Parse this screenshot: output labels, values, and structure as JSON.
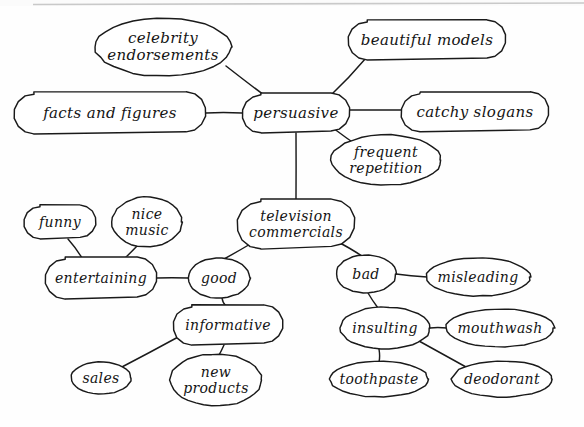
{
  "diagram": {
    "type": "hand-drawn mind map / concept web",
    "medium": "ink on paper, cursive handwriting",
    "ink_color": "#1a1a1a",
    "paper_color": "#fefefe",
    "scan_edge_color": "#c9c9c9",
    "width": 584,
    "height": 427
  },
  "nodes": [
    {
      "id": "celebrity_endorsements",
      "label_line1": "celebrity",
      "label_line2": "endorsements",
      "cx": 163,
      "cy": 47,
      "rx": 68,
      "ry": 29,
      "shape": "ellipse",
      "lines": 2,
      "font_size": 15
    },
    {
      "id": "beautiful_models",
      "label_line1": "beautiful  models",
      "label_line2": "",
      "cx": 427,
      "cy": 40,
      "rx": 79,
      "ry": 20,
      "shape": "rounded",
      "lines": 1,
      "font_size": 15
    },
    {
      "id": "facts_and_figures",
      "label_line1": "facts  and  figures",
      "label_line2": "",
      "cx": 110,
      "cy": 113,
      "rx": 96,
      "ry": 21,
      "shape": "rounded",
      "lines": 1,
      "font_size": 15
    },
    {
      "id": "persuasive",
      "label_line1": "persuasive",
      "label_line2": "",
      "cx": 296,
      "cy": 113,
      "rx": 54,
      "ry": 20,
      "shape": "rounded",
      "lines": 1,
      "font_size": 15
    },
    {
      "id": "catchy_slogans",
      "label_line1": "catchy  slogans",
      "label_line2": "",
      "cx": 475,
      "cy": 112,
      "rx": 74,
      "ry": 20,
      "shape": "rounded",
      "lines": 1,
      "font_size": 15
    },
    {
      "id": "frequent_repetition",
      "label_line1": "frequent",
      "label_line2": "repetition",
      "cx": 386,
      "cy": 160,
      "rx": 55,
      "ry": 25,
      "shape": "ellipse",
      "lines": 2,
      "font_size": 14
    },
    {
      "id": "television_commercials",
      "label_line1": "television",
      "label_line2": "commercials",
      "cx": 296,
      "cy": 224,
      "rx": 59,
      "ry": 25,
      "shape": "rounded",
      "lines": 2,
      "font_size": 14
    },
    {
      "id": "funny",
      "label_line1": "funny",
      "label_line2": "",
      "cx": 60,
      "cy": 222,
      "rx": 36,
      "ry": 17,
      "shape": "rounded",
      "lines": 1,
      "font_size": 14
    },
    {
      "id": "nice_music",
      "label_line1": "nice",
      "label_line2": "music",
      "cx": 147,
      "cy": 222,
      "rx": 35,
      "ry": 25,
      "shape": "ellipse",
      "lines": 2,
      "font_size": 14
    },
    {
      "id": "entertaining",
      "label_line1": "entertaining",
      "label_line2": "",
      "cx": 101,
      "cy": 278,
      "rx": 56,
      "ry": 21,
      "shape": "rounded",
      "lines": 1,
      "font_size": 14
    },
    {
      "id": "good",
      "label_line1": "good",
      "label_line2": "",
      "cx": 219,
      "cy": 278,
      "rx": 31,
      "ry": 20,
      "shape": "ellipse",
      "lines": 1,
      "font_size": 14
    },
    {
      "id": "bad",
      "label_line1": "bad",
      "label_line2": "",
      "cx": 366,
      "cy": 274,
      "rx": 30,
      "ry": 19,
      "shape": "ellipse",
      "lines": 1,
      "font_size": 14
    },
    {
      "id": "misleading",
      "label_line1": "misleading",
      "label_line2": "",
      "cx": 478,
      "cy": 277,
      "rx": 52,
      "ry": 19,
      "shape": "ellipse",
      "lines": 1,
      "font_size": 14
    },
    {
      "id": "informative",
      "label_line1": "informative",
      "label_line2": "",
      "cx": 228,
      "cy": 325,
      "rx": 55,
      "ry": 20,
      "shape": "rounded",
      "lines": 1,
      "font_size": 14
    },
    {
      "id": "insulting",
      "label_line1": "insulting",
      "label_line2": "",
      "cx": 385,
      "cy": 328,
      "rx": 45,
      "ry": 21,
      "shape": "ellipse",
      "lines": 1,
      "font_size": 14
    },
    {
      "id": "mouthwash",
      "label_line1": "mouthwash",
      "label_line2": "",
      "cx": 500,
      "cy": 328,
      "rx": 54,
      "ry": 19,
      "shape": "ellipse",
      "lines": 1,
      "font_size": 14
    },
    {
      "id": "sales",
      "label_line1": "sales",
      "label_line2": "",
      "cx": 101,
      "cy": 378,
      "rx": 30,
      "ry": 16,
      "shape": "ellipse",
      "lines": 1,
      "font_size": 14
    },
    {
      "id": "new_products",
      "label_line1": "new",
      "label_line2": "products",
      "cx": 216,
      "cy": 380,
      "rx": 46,
      "ry": 26,
      "shape": "ellipse",
      "lines": 2,
      "font_size": 14
    },
    {
      "id": "toothpaste",
      "label_line1": "toothpaste",
      "label_line2": "",
      "cx": 379,
      "cy": 379,
      "rx": 49,
      "ry": 18,
      "shape": "ellipse",
      "lines": 1,
      "font_size": 14
    },
    {
      "id": "deodorant",
      "label_line1": "deodorant",
      "label_line2": "",
      "cx": 502,
      "cy": 379,
      "rx": 50,
      "ry": 18,
      "shape": "ellipse",
      "lines": 1,
      "font_size": 14
    }
  ],
  "edges": [
    {
      "id": "e1",
      "from": "celebrity_endorsements",
      "to": "persuasive",
      "x1": 226,
      "y1": 66,
      "x2": 268,
      "y2": 98
    },
    {
      "id": "e2",
      "from": "beautiful_models",
      "to": "persuasive",
      "x1": 366,
      "y1": 58,
      "x2": 330,
      "y2": 96
    },
    {
      "id": "e3",
      "from": "facts_and_figures",
      "to": "persuasive",
      "x1": 206,
      "y1": 113,
      "x2": 242,
      "y2": 113
    },
    {
      "id": "e4",
      "from": "persuasive",
      "to": "catchy_slogans",
      "x1": 350,
      "y1": 110,
      "x2": 401,
      "y2": 110
    },
    {
      "id": "e5",
      "from": "persuasive",
      "to": "frequent_repetition",
      "x1": 333,
      "y1": 128,
      "x2": 358,
      "y2": 146
    },
    {
      "id": "e6",
      "from": "persuasive",
      "to": "television_commercials",
      "x1": 296,
      "y1": 133,
      "x2": 296,
      "y2": 200
    },
    {
      "id": "e7",
      "from": "television_commercials",
      "to": "good",
      "x1": 252,
      "y1": 243,
      "x2": 224,
      "y2": 259
    },
    {
      "id": "e8",
      "from": "television_commercials",
      "to": "bad",
      "x1": 340,
      "y1": 243,
      "x2": 362,
      "y2": 256
    },
    {
      "id": "e9",
      "from": "funny",
      "to": "entertaining",
      "x1": 68,
      "y1": 239,
      "x2": 82,
      "y2": 258
    },
    {
      "id": "e10",
      "from": "nice_music",
      "to": "entertaining",
      "x1": 137,
      "y1": 246,
      "x2": 124,
      "y2": 259
    },
    {
      "id": "e11",
      "from": "entertaining",
      "to": "good",
      "x1": 157,
      "y1": 278,
      "x2": 188,
      "y2": 278
    },
    {
      "id": "e12",
      "from": "good",
      "to": "informative",
      "x1": 222,
      "y1": 298,
      "x2": 226,
      "y2": 306
    },
    {
      "id": "e13",
      "from": "informative",
      "to": "sales",
      "x1": 180,
      "y1": 336,
      "x2": 120,
      "y2": 368
    },
    {
      "id": "e14",
      "from": "informative",
      "to": "new_products",
      "x1": 224,
      "y1": 345,
      "x2": 219,
      "y2": 355
    },
    {
      "id": "e15",
      "from": "bad",
      "to": "misleading",
      "x1": 396,
      "y1": 274,
      "x2": 427,
      "y2": 277
    },
    {
      "id": "e16",
      "from": "bad",
      "to": "insulting",
      "x1": 368,
      "y1": 293,
      "x2": 378,
      "y2": 308
    },
    {
      "id": "e17",
      "from": "insulting",
      "to": "mouthwash",
      "x1": 430,
      "y1": 328,
      "x2": 447,
      "y2": 328
    },
    {
      "id": "e18",
      "from": "insulting",
      "to": "toothpaste",
      "x1": 379,
      "y1": 349,
      "x2": 379,
      "y2": 362
    },
    {
      "id": "e19",
      "from": "insulting",
      "to": "deodorant",
      "x1": 419,
      "y1": 341,
      "x2": 466,
      "y2": 367
    }
  ],
  "branches": {
    "persuasive_children": [
      "celebrity endorsements",
      "beautiful models",
      "facts and figures",
      "catchy slogans",
      "frequent repetition"
    ],
    "good_children": [
      "entertaining",
      "informative"
    ],
    "entertaining_children": [
      "funny",
      "nice music"
    ],
    "informative_children": [
      "sales",
      "new products"
    ],
    "bad_children": [
      "misleading",
      "insulting"
    ],
    "insulting_children": [
      "mouthwash",
      "toothpaste",
      "deodorant"
    ]
  }
}
